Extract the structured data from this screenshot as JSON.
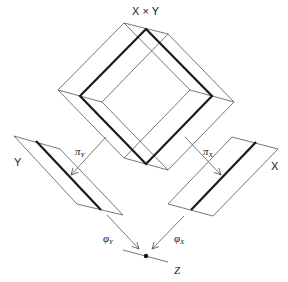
{
  "labels": {
    "product": "X × Y",
    "space_y": "Y",
    "space_x": "X",
    "target": "Z",
    "proj_y": "π",
    "proj_y_sub": "Y",
    "proj_x": "π",
    "proj_x_sub": "X",
    "map_y": "φ",
    "map_y_sub": "Y",
    "map_x": "φ",
    "map_x_sub": "X"
  },
  "colors": {
    "thin_line": "#555555",
    "thick_line": "#1a1a1a",
    "background": "#ffffff"
  },
  "geometry": {
    "product_face_front": [
      [
        124,
        23
      ],
      [
        190,
        90
      ],
      [
        124,
        158
      ],
      [
        58,
        90
      ]
    ],
    "product_face_back": [
      [
        168,
        34
      ],
      [
        234,
        102
      ],
      [
        168,
        170
      ],
      [
        102,
        102
      ]
    ],
    "product_section_thick": [
      [
        146,
        29
      ],
      [
        212,
        96
      ],
      [
        146,
        164
      ],
      [
        80,
        96
      ]
    ],
    "y_parallelogram": [
      [
        14,
        136
      ],
      [
        60,
        149
      ],
      [
        123,
        215
      ],
      [
        77,
        204
      ]
    ],
    "y_thick_line": [
      [
        36,
        141
      ],
      [
        101,
        210
      ]
    ],
    "x_parallelogram": [
      [
        232,
        137
      ],
      [
        278,
        149
      ],
      [
        213,
        216
      ],
      [
        168,
        204
      ]
    ],
    "x_thick_line": [
      [
        256,
        142
      ],
      [
        191,
        210
      ]
    ],
    "z_line": [
      [
        123,
        250
      ],
      [
        168,
        262
      ]
    ],
    "z_point": [
      146,
      256
    ]
  }
}
